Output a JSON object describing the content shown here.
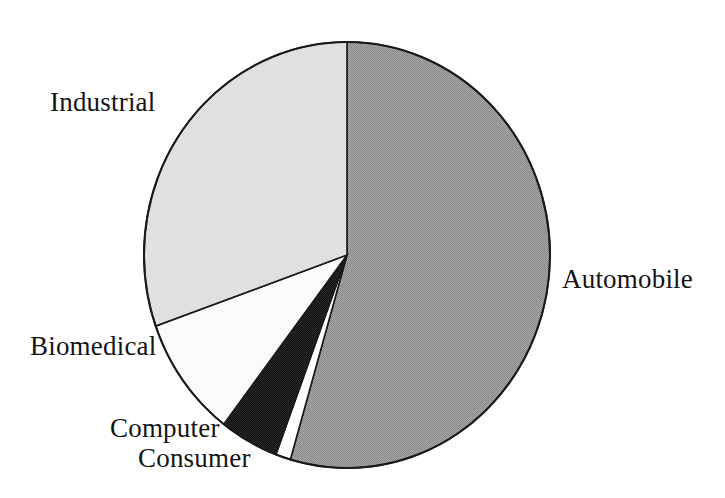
{
  "chart_data": {
    "type": "pie",
    "title": "",
    "subtitle": "",
    "xlabel": "",
    "ylabel": "",
    "legend_position": "none",
    "grid": false,
    "labels_outside": true,
    "start_angle_deg": 0,
    "direction": "clockwise",
    "categories": [
      "Automobile",
      "Consumer",
      "Computer",
      "Biomedical",
      "Industrial"
    ],
    "values": [
      54.5,
      1.2,
      4.7,
      9.2,
      30.4
    ],
    "units": "percent",
    "slices": [
      {
        "label": "Automobile",
        "value": 54.5,
        "start_deg": 0,
        "end_deg": 196.2,
        "color": "#9a9a9a",
        "fill_style": "medium-gray-dither"
      },
      {
        "label": "Consumer",
        "value": 1.2,
        "start_deg": 196.2,
        "end_deg": 200.5,
        "color": "#ffffff",
        "fill_style": "white"
      },
      {
        "label": "Computer",
        "value": 4.7,
        "start_deg": 200.5,
        "end_deg": 217.4,
        "color": "#1c1c1c",
        "fill_style": "black-dither"
      },
      {
        "label": "Biomedical",
        "value": 9.2,
        "start_deg": 217.4,
        "end_deg": 250.5,
        "color": "#fbfbfb",
        "fill_style": "near-white"
      },
      {
        "label": "Industrial",
        "value": 30.4,
        "start_deg": 250.5,
        "end_deg": 360,
        "color": "#e2e2e2",
        "fill_style": "light-gray-dither"
      }
    ]
  },
  "labels": {
    "industrial": "Industrial",
    "automobile": "Automobile",
    "biomedical": "Biomedical",
    "computer": "Computer",
    "consumer": "Consumer"
  },
  "geometry": {
    "center_x": 347,
    "center_y": 255,
    "radius_x": 203,
    "radius_y": 213,
    "outline_color": "#1a1a1a",
    "outline_width": 2
  }
}
